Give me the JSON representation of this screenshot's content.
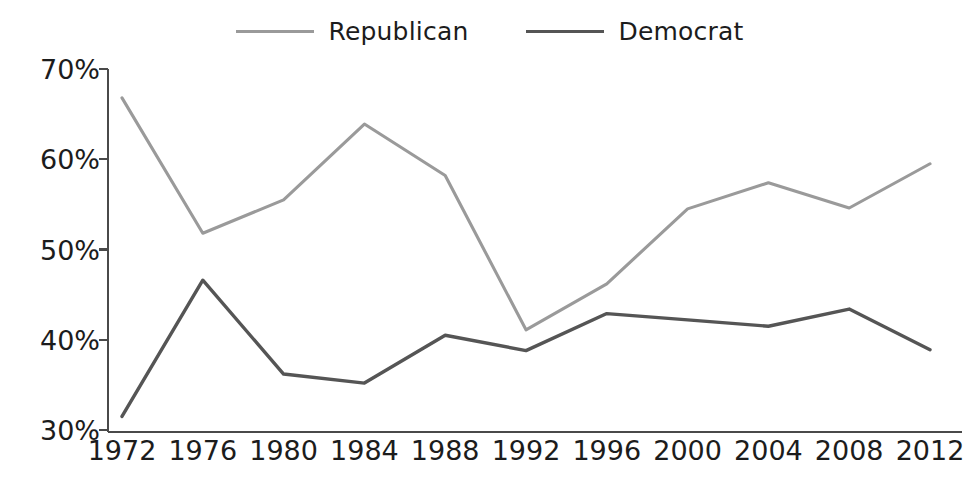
{
  "chart_data": {
    "type": "line",
    "title": "",
    "subtitle": "",
    "xlabel": "",
    "ylabel": "",
    "x": [
      1972,
      1976,
      1980,
      1984,
      1988,
      1992,
      1996,
      2000,
      2004,
      2008,
      2012
    ],
    "xtick_labels": [
      "1972",
      "1976",
      "1980",
      "1984",
      "1988",
      "1992",
      "1996",
      "2000",
      "2004",
      "2008",
      "2012"
    ],
    "ytick_labels": [
      "70%",
      "60%",
      "50%",
      "40%",
      "30%"
    ],
    "yticks": [
      70,
      60,
      50,
      40,
      30
    ],
    "ylim": [
      30,
      70
    ],
    "xlim": [
      1972,
      2012
    ],
    "grid": false,
    "legend_position": "top-center",
    "series": [
      {
        "name": "Republican",
        "color": "#9a9a9a",
        "values": [
          66.8,
          51.8,
          55.5,
          63.9,
          58.2,
          41.1,
          46.2,
          54.5,
          57.4,
          54.6,
          59.5
        ]
      },
      {
        "name": "Democrat",
        "color": "#555555",
        "values": [
          31.5,
          46.6,
          36.2,
          35.2,
          40.5,
          38.8,
          42.9,
          42.2,
          41.5,
          43.4,
          38.9
        ]
      }
    ]
  },
  "legend": {
    "items": [
      {
        "label": "Republican",
        "color": "#9a9a9a"
      },
      {
        "label": "Democrat",
        "color": "#555555"
      }
    ]
  },
  "axes": {
    "y_labels": [
      "70%",
      "60%",
      "50%",
      "40%",
      "30%"
    ],
    "x_labels": [
      "1972",
      "1976",
      "1980",
      "1984",
      "1988",
      "1992",
      "1996",
      "2000",
      "2004",
      "2008",
      "2012"
    ],
    "axis_color": "#4a4a4a"
  }
}
